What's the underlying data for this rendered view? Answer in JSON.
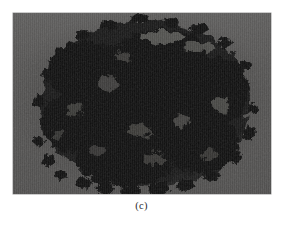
{
  "figure": {
    "caption": "(c)",
    "panel_label": "c",
    "image_kind": "micrograph",
    "colors": {
      "page_background": "#ffffff",
      "field_gray": "#555453",
      "particle_dark": "#0b0b0b",
      "particle_mid": "#2c2c2c",
      "particle_highlight": "#6e6d6a",
      "frame_border": "#9a9a9a",
      "caption_text": "#2a2a2a"
    },
    "geometry": {
      "frame_left": 13,
      "frame_top": 13,
      "frame_width": 258,
      "frame_height": 181,
      "caption_top": 199
    }
  }
}
